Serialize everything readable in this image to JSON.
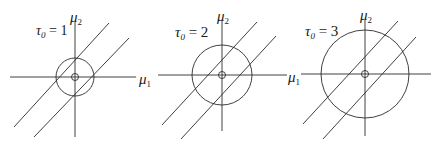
{
  "figure": {
    "panels": [
      {
        "id": "panel-1",
        "tau_symbol": "τ",
        "tau_sub": "0",
        "tau_eq": " = 1",
        "x_label": "μ",
        "x_sub": "1",
        "y_label": "μ",
        "y_sub": "2",
        "center": [
          75,
          77
        ],
        "circle_radius": 19,
        "origin_marker_radius": 3.5
      },
      {
        "id": "panel-2",
        "tau_symbol": "τ",
        "tau_sub": "0",
        "tau_eq": " = 2",
        "x_label": "μ",
        "x_sub": "1",
        "y_label": "μ",
        "y_sub": "2",
        "center": [
          222,
          75
        ],
        "circle_radius": 30,
        "origin_marker_radius": 3.5
      },
      {
        "id": "panel-3",
        "tau_symbol": "τ",
        "tau_sub": "0",
        "tau_eq": " = 3",
        "x_label": "μ",
        "x_sub": "1",
        "y_label": "μ",
        "y_sub": "2",
        "center": [
          365,
          74
        ],
        "circle_radius": 44,
        "origin_marker_radius": 3.5
      }
    ]
  }
}
